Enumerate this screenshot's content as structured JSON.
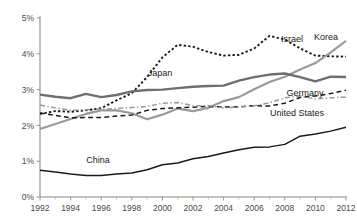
{
  "chart_data": {
    "type": "line",
    "title": "",
    "subtitle": "",
    "xlabel": "",
    "ylabel": "",
    "xlim": [
      1992,
      2012
    ],
    "ylim": [
      0,
      5
    ],
    "grid": false,
    "legend_position": "inline-labels",
    "y_tick_labels": [
      "0%",
      "1%",
      "2%",
      "3%",
      "4%",
      "5%"
    ],
    "y_tick_values": [
      0,
      1,
      2,
      3,
      4,
      5
    ],
    "x_tick_labels": [
      "1992",
      "1994",
      "1996",
      "1998",
      "2000",
      "2002",
      "2004",
      "2006",
      "2008",
      "2010",
      "2012"
    ],
    "x_tick_values": [
      1992,
      1994,
      1996,
      1998,
      2000,
      2002,
      2004,
      2006,
      2008,
      2010,
      2012
    ],
    "x_minor_ticks": [
      1993,
      1995,
      1997,
      1999,
      2001,
      2003,
      2005,
      2007,
      2009,
      2011
    ],
    "x": [
      1992,
      1993,
      1994,
      1995,
      1996,
      1997,
      1998,
      1999,
      2000,
      2001,
      2002,
      2003,
      2004,
      2005,
      2006,
      2007,
      2008,
      2009,
      2010,
      2011,
      2012
    ],
    "series": [
      {
        "name": "Israel",
        "label": "Israel",
        "color": "#1a1a1a",
        "style": "dotted",
        "width": 1.9,
        "label_x": 292,
        "label_y": 42,
        "values": [
          2.32,
          2.4,
          2.38,
          2.42,
          2.48,
          2.7,
          2.9,
          3.35,
          3.9,
          4.25,
          4.2,
          4.05,
          3.95,
          3.97,
          4.15,
          4.5,
          4.4,
          4.15,
          3.95,
          3.93,
          3.92
        ]
      },
      {
        "name": "Korea",
        "label": "Korea",
        "color": "#9a9a9a",
        "style": "solid",
        "width": 2.2,
        "label_x": 326,
        "label_y": 40,
        "values": [
          1.9,
          2.04,
          2.18,
          2.32,
          2.42,
          2.42,
          2.34,
          2.17,
          2.3,
          2.47,
          2.4,
          2.49,
          2.68,
          2.79,
          3.01,
          3.21,
          3.36,
          3.56,
          3.74,
          4.04,
          4.36
        ]
      },
      {
        "name": "Japan",
        "label": "Japan",
        "color": "#6e6e6e",
        "style": "solid",
        "width": 2.4,
        "label_x": 160,
        "label_y": 76,
        "values": [
          2.86,
          2.8,
          2.76,
          2.88,
          2.79,
          2.85,
          2.95,
          2.99,
          3.0,
          3.04,
          3.08,
          3.1,
          3.11,
          3.25,
          3.35,
          3.42,
          3.45,
          3.35,
          3.23,
          3.36,
          3.35
        ]
      },
      {
        "name": "Germany",
        "label": "Germany",
        "color": "#1a1a1a",
        "style": "dashed",
        "width": 1.5,
        "label_x": 305,
        "label_y": 96,
        "values": [
          2.35,
          2.28,
          2.21,
          2.22,
          2.22,
          2.26,
          2.29,
          2.42,
          2.47,
          2.49,
          2.51,
          2.53,
          2.51,
          2.52,
          2.55,
          2.54,
          2.62,
          2.78,
          2.82,
          2.89,
          2.98
        ]
      },
      {
        "name": "United States",
        "label": "United States",
        "color": "#9a9a9a",
        "style": "dashdot",
        "width": 1.5,
        "label_x": 297,
        "label_y": 116,
        "values": [
          2.57,
          2.49,
          2.42,
          2.44,
          2.45,
          2.47,
          2.5,
          2.53,
          2.62,
          2.64,
          2.55,
          2.55,
          2.49,
          2.51,
          2.55,
          2.63,
          2.77,
          2.82,
          2.74,
          2.77,
          2.79
        ]
      },
      {
        "name": "China",
        "label": "China",
        "color": "#1a1a1a",
        "style": "solid",
        "width": 1.5,
        "label_x": 98,
        "label_y": 163,
        "values": [
          0.75,
          0.7,
          0.64,
          0.6,
          0.6,
          0.64,
          0.67,
          0.76,
          0.9,
          0.95,
          1.07,
          1.13,
          1.23,
          1.32,
          1.39,
          1.4,
          1.47,
          1.7,
          1.76,
          1.84,
          1.95
        ]
      }
    ]
  }
}
